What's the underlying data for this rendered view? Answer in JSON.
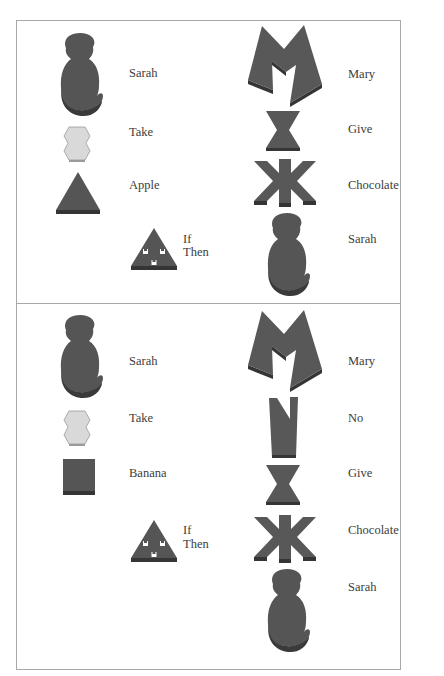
{
  "colors": {
    "token_dark": "#555555",
    "token_edge": "#3a3a3a",
    "token_light": "#d8d8d8",
    "border": "#a8a8a8",
    "text": "#3c3c3c"
  },
  "panels": [
    {
      "name": "sentence-1",
      "left_column": [
        {
          "icon": "monkey-token-icon",
          "label": "Sarah"
        },
        {
          "icon": "hexagon-token-icon",
          "label": "Take"
        },
        {
          "icon": "triangle-token-icon",
          "label": "Apple"
        },
        {
          "icon": "conditional-triangle-token-icon",
          "label_line1": "If",
          "label_line2": "Then"
        }
      ],
      "right_column": [
        {
          "icon": "m-shape-token-icon",
          "label": "Mary"
        },
        {
          "icon": "hourglass-token-icon",
          "label": "Give"
        },
        {
          "icon": "asterisk-token-icon",
          "label": "Chocolate"
        },
        {
          "icon": "monkey-token-icon",
          "label": "Sarah"
        }
      ]
    },
    {
      "name": "sentence-2",
      "left_column": [
        {
          "icon": "monkey-token-icon",
          "label": "Sarah"
        },
        {
          "icon": "hexagon-token-icon",
          "label": "Take"
        },
        {
          "icon": "square-token-icon",
          "label": "Banana"
        },
        {
          "icon": "conditional-triangle-token-icon",
          "label_line1": "If",
          "label_line2": "Then"
        }
      ],
      "right_column": [
        {
          "icon": "m-shape-token-icon",
          "label": "Mary"
        },
        {
          "icon": "notched-bar-token-icon",
          "label": "No"
        },
        {
          "icon": "hourglass-token-icon",
          "label": "Give"
        },
        {
          "icon": "asterisk-token-icon",
          "label": "Chocolate"
        },
        {
          "icon": "monkey-token-icon",
          "label": "Sarah"
        }
      ]
    }
  ]
}
